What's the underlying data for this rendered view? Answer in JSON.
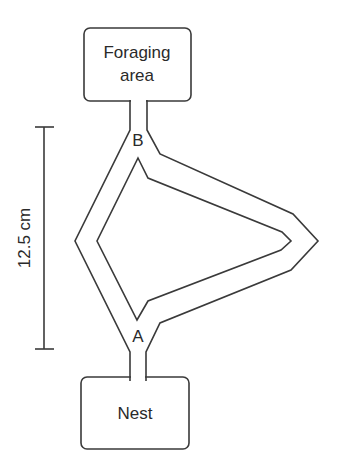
{
  "diagram": {
    "type": "maze_apparatus",
    "foraging_box": {
      "line1": "Foraging",
      "line2": "area"
    },
    "nest_box": {
      "label": "Nest"
    },
    "junctions": {
      "top": "B",
      "bottom": "A"
    },
    "scale_bar": {
      "label": "12.5 cm"
    },
    "branches": [
      "short-left-branch",
      "long-right-branch"
    ],
    "colors": {
      "line": "#3a3a3a",
      "text": "#2a2a2a",
      "background": "#ffffff"
    }
  }
}
